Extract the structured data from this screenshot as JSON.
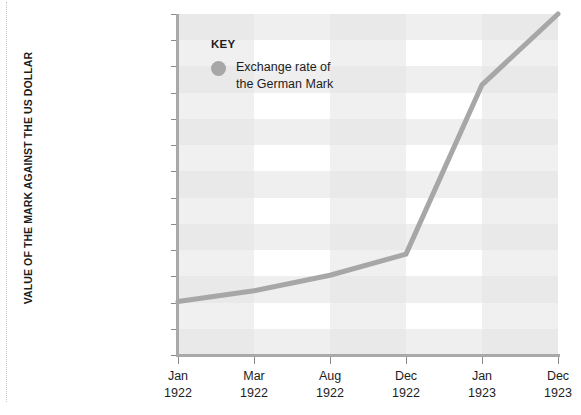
{
  "chart_data": {
    "type": "line",
    "title": "",
    "subtitle": "",
    "xlabel": "",
    "ylabel": "VALUE OF THE MARK AGAINST THE US DOLLAR",
    "y_scale": "log",
    "y_tick_labels": [
      "10,000,000,000,000",
      "1,000,000,000,000",
      "100,000,000,000",
      "10,000,000,000",
      "1,000,000,000",
      "100,000,000",
      "10,000,000",
      "1,000,000",
      "100,000",
      "10,000",
      "1,000",
      "100",
      "10",
      "0"
    ],
    "y_tick_values": [
      10000000000000.0,
      1000000000000.0,
      100000000000.0,
      10000000000.0,
      1000000000.0,
      100000000.0,
      10000000.0,
      1000000.0,
      100000.0,
      10000.0,
      1000,
      100,
      10,
      0
    ],
    "ylim": [
      0,
      10000000000000.0
    ],
    "x_tick_labels": [
      {
        "month": "Jan",
        "year": "1922"
      },
      {
        "month": "Mar",
        "year": "1922"
      },
      {
        "month": "Aug",
        "year": "1922"
      },
      {
        "month": "Dec",
        "year": "1922"
      },
      {
        "month": "Jan",
        "year": "1923"
      },
      {
        "month": "Dec",
        "year": "1923"
      }
    ],
    "categories": [
      "Jan 1922",
      "Mar 1922",
      "Aug 1922",
      "Dec 1922",
      "Jan 1923",
      "Dec 1923"
    ],
    "series": [
      {
        "name": "Exchange rate of the German Mark",
        "color": "#a7a7a7",
        "values": [
          110,
          280,
          1100,
          7000,
          20000000000,
          10000000000000
        ]
      }
    ],
    "grid": "horizontal and vertical alternating bands",
    "legend_position": "inside top-left"
  },
  "legend": {
    "title": "KEY",
    "entries": [
      {
        "label_line1": "Exchange rate of",
        "label_line2": "the German Mark",
        "color": "#a7a7a7"
      }
    ]
  },
  "colors": {
    "line": "#a7a7a7",
    "axis": "#a9a9a9",
    "band": "#efefef",
    "text": "#1d1d1d",
    "background": "#ffffff"
  }
}
